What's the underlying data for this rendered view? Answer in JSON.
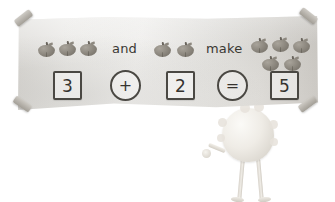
{
  "worksheet": {
    "title": "Apple addition banner",
    "sentence": {
      "left_group_label": "and",
      "right_group_label": "make"
    },
    "groups": [
      {
        "name": "addend-one",
        "count": 3,
        "item": "apple"
      },
      {
        "name": "addend-two",
        "count": 2,
        "item": "apple"
      },
      {
        "name": "sum-group",
        "count": 5,
        "item": "apple"
      }
    ],
    "equation": {
      "addend_one": "3",
      "plus_sign": "+",
      "addend_two": "2",
      "equals_sign": "=",
      "sum": "5"
    },
    "colors": {
      "banner": "#ebe9e6",
      "ink": "#35332f",
      "apple": "#8f8a81",
      "tape": "#b9b5ae",
      "creature": "#efece6"
    },
    "creature": {
      "name": "fuzzy-monster",
      "pose": "holding-banner"
    }
  }
}
